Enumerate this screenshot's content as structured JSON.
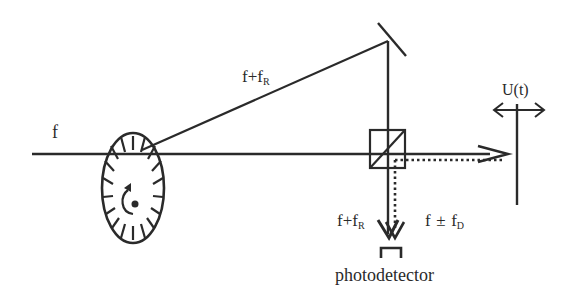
{
  "diagram": {
    "colors": {
      "line": "#2a2a2a",
      "background": "#ffffff"
    },
    "labels": {
      "input_beam": "f",
      "reference_beam_main": "f+f",
      "reference_beam_sub": "R",
      "target_motion": "U(t)",
      "detector_ref_main": "f+f",
      "detector_ref_sub": "R",
      "detector_signal_main_a": "f",
      "detector_signal_pm": "±",
      "detector_signal_main_b": "f",
      "detector_signal_sub": "D",
      "detector": "photodetector"
    },
    "components": [
      {
        "id": "rotating-grating",
        "kind": "ellipse disk with radial slits and rotation arrow"
      },
      {
        "id": "mirror",
        "kind": "angled mirror"
      },
      {
        "id": "beam-splitter",
        "kind": "cube with diagonal"
      },
      {
        "id": "moving-target",
        "kind": "vertical surface with double-headed motion arrow"
      },
      {
        "id": "photodetector",
        "kind": "bracket detector"
      }
    ],
    "beams": [
      {
        "id": "input",
        "style": "solid",
        "label": "f"
      },
      {
        "id": "diffracted",
        "style": "solid",
        "label": "f+f_R"
      },
      {
        "id": "to-target",
        "style": "solid arrow"
      },
      {
        "id": "return-from-target",
        "style": "dotted",
        "label": "f ± f_D"
      },
      {
        "id": "reference-down",
        "style": "solid arrow",
        "label": "f+f_R"
      }
    ]
  }
}
